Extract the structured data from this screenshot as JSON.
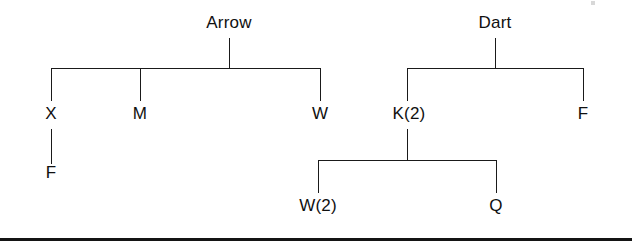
{
  "figure": {
    "type": "pedigree-tree-diagram",
    "width": 632,
    "height": 250,
    "background_color": "#ffffff",
    "line_color": "#1a1a1a",
    "text_color": "#101010"
  },
  "trees": [
    {
      "id": "arrow-tree",
      "root": {
        "label": "Arrow",
        "x": 229,
        "y": 26
      },
      "children": [
        {
          "label": "X",
          "x": 51,
          "y": 121
        },
        {
          "label": "M",
          "x": 140,
          "y": 121
        },
        {
          "label": "W",
          "x": 320,
          "y": 121
        }
      ],
      "grandchildren": [
        {
          "label": "F",
          "parent": "X",
          "x": 51,
          "y": 180
        }
      ]
    },
    {
      "id": "dart-tree",
      "root": {
        "label": "Dart",
        "x": 495,
        "y": 26
      },
      "children": [
        {
          "label": "K(2)",
          "x": 409,
          "y": 121
        },
        {
          "label": "F",
          "x": 583,
          "y": 121
        }
      ],
      "grandchildren": [
        {
          "label": "W(2)",
          "parent": "K(2)",
          "x": 318,
          "y": 213
        },
        {
          "label": "Q",
          "parent": "K(2)",
          "x": 496,
          "y": 213
        }
      ]
    }
  ],
  "rules": [
    {
      "name": "bottom-rule",
      "y": 238,
      "thickness": 3
    }
  ]
}
